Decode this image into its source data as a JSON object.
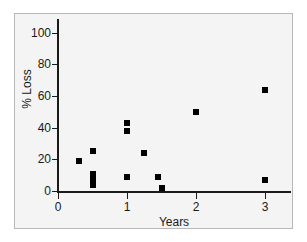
{
  "chart_data": {
    "type": "scatter",
    "title": "",
    "xlabel": "Years",
    "ylabel": "% Loss",
    "xlim": [
      0,
      3.4
    ],
    "ylim": [
      0,
      107
    ],
    "grid": false,
    "legend": null,
    "marker": {
      "shape": "square",
      "color": "#000000",
      "size_px": 6
    },
    "x_ticks": [
      0,
      1,
      2,
      3
    ],
    "x_tick_labels": [
      "0",
      "1",
      "2",
      "3"
    ],
    "y_ticks": [
      0,
      20,
      40,
      60,
      80,
      100
    ],
    "y_tick_labels": [
      "0",
      "20",
      "40",
      "60",
      "80",
      "100"
    ],
    "series": [
      {
        "name": "observations",
        "points": [
          {
            "x": 0.3,
            "y": 19
          },
          {
            "x": 0.5,
            "y": 25
          },
          {
            "x": 0.5,
            "y": 11
          },
          {
            "x": 0.5,
            "y": 7
          },
          {
            "x": 0.5,
            "y": 4
          },
          {
            "x": 1.0,
            "y": 43
          },
          {
            "x": 1.0,
            "y": 38
          },
          {
            "x": 1.0,
            "y": 9
          },
          {
            "x": 1.25,
            "y": 24
          },
          {
            "x": 1.45,
            "y": 9
          },
          {
            "x": 1.5,
            "y": 2
          },
          {
            "x": 2.0,
            "y": 50
          },
          {
            "x": 3.0,
            "y": 64
          },
          {
            "x": 3.0,
            "y": 7
          }
        ]
      }
    ]
  },
  "figure": {
    "background_color": "#ffffff",
    "panel_color": "#f4f4f4",
    "panel_border_color": "#b8b8b8",
    "axis_color": "#1a1a1a"
  }
}
